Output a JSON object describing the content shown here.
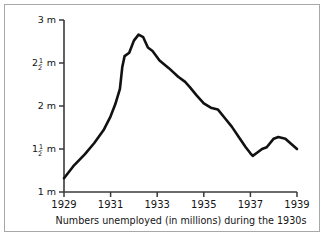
{
  "chart_data": {
    "type": "line",
    "title": "",
    "caption": "Numbers unemployed (in millions) during the 1930s",
    "xlabel": "",
    "ylabel": "",
    "xlim": [
      1929,
      1939
    ],
    "ylim": [
      1,
      3
    ],
    "grid": false,
    "legend": null,
    "x_ticks": [
      {
        "value": 1929,
        "label": "1929"
      },
      {
        "value": 1931,
        "label": "1931"
      },
      {
        "value": 1933,
        "label": "1933"
      },
      {
        "value": 1935,
        "label": "1935"
      },
      {
        "value": 1937,
        "label": "1937"
      },
      {
        "value": 1939,
        "label": "1939"
      }
    ],
    "y_ticks": [
      {
        "value": 3,
        "label": "3 m",
        "whole": "3",
        "numerator": "",
        "denominator": "",
        "unit": "m"
      },
      {
        "value": 2.5,
        "label": "2 1/2 m",
        "whole": "2",
        "numerator": "1",
        "denominator": "2",
        "unit": "m"
      },
      {
        "value": 2,
        "label": "2 m",
        "whole": "2",
        "numerator": "",
        "denominator": "",
        "unit": "m"
      },
      {
        "value": 1.5,
        "label": "1 1/2 m",
        "whole": "1",
        "numerator": "1",
        "denominator": "2",
        "unit": "m"
      },
      {
        "value": 1,
        "label": "1 m",
        "whole": "1",
        "numerator": "",
        "denominator": "",
        "unit": "m"
      }
    ],
    "series": [
      {
        "name": "Numbers unemployed",
        "color": "#111111",
        "points": [
          {
            "x": 1929.0,
            "y": 1.16
          },
          {
            "x": 1929.4,
            "y": 1.3
          },
          {
            "x": 1929.9,
            "y": 1.44
          },
          {
            "x": 1930.3,
            "y": 1.57
          },
          {
            "x": 1930.7,
            "y": 1.72
          },
          {
            "x": 1931.0,
            "y": 1.88
          },
          {
            "x": 1931.2,
            "y": 2.02
          },
          {
            "x": 1931.4,
            "y": 2.2
          },
          {
            "x": 1931.5,
            "y": 2.45
          },
          {
            "x": 1931.6,
            "y": 2.58
          },
          {
            "x": 1931.8,
            "y": 2.62
          },
          {
            "x": 1932.0,
            "y": 2.76
          },
          {
            "x": 1932.2,
            "y": 2.83
          },
          {
            "x": 1932.4,
            "y": 2.8
          },
          {
            "x": 1932.6,
            "y": 2.68
          },
          {
            "x": 1932.8,
            "y": 2.64
          },
          {
            "x": 1933.1,
            "y": 2.53
          },
          {
            "x": 1933.5,
            "y": 2.44
          },
          {
            "x": 1933.9,
            "y": 2.34
          },
          {
            "x": 1934.2,
            "y": 2.28
          },
          {
            "x": 1934.4,
            "y": 2.22
          },
          {
            "x": 1934.7,
            "y": 2.12
          },
          {
            "x": 1935.0,
            "y": 2.03
          },
          {
            "x": 1935.3,
            "y": 1.98
          },
          {
            "x": 1935.6,
            "y": 1.96
          },
          {
            "x": 1935.9,
            "y": 1.86
          },
          {
            "x": 1936.2,
            "y": 1.76
          },
          {
            "x": 1936.5,
            "y": 1.64
          },
          {
            "x": 1936.8,
            "y": 1.52
          },
          {
            "x": 1937.0,
            "y": 1.45
          },
          {
            "x": 1937.1,
            "y": 1.42
          },
          {
            "x": 1937.3,
            "y": 1.46
          },
          {
            "x": 1937.5,
            "y": 1.5
          },
          {
            "x": 1937.7,
            "y": 1.52
          },
          {
            "x": 1938.0,
            "y": 1.62
          },
          {
            "x": 1938.2,
            "y": 1.64
          },
          {
            "x": 1938.5,
            "y": 1.62
          },
          {
            "x": 1939.0,
            "y": 1.5
          }
        ]
      }
    ],
    "axis": {
      "color": "#3a3a3a",
      "origin_px": {
        "x": 64,
        "y": 192
      },
      "top_px": 20,
      "right_px": 297
    }
  }
}
